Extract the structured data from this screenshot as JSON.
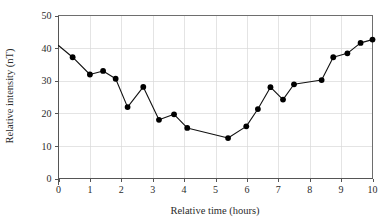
{
  "chart_data": {
    "type": "line",
    "title": "",
    "subtitle": "",
    "xlabel": "Relative time (hours)",
    "ylabel": "Relative intensity (nT)",
    "xlim": [
      0,
      10
    ],
    "ylim": [
      0,
      50
    ],
    "xticks": [
      0,
      1,
      2,
      3,
      4,
      5,
      6,
      7,
      8,
      9,
      10
    ],
    "yticks": [
      0,
      10,
      20,
      30,
      40,
      50
    ],
    "xtick_labels": [
      "0",
      "1",
      "2",
      "3",
      "4",
      "5",
      "6",
      "7",
      "8",
      "9",
      "10"
    ],
    "ytick_labels": [
      "0",
      "10",
      "20",
      "30",
      "40",
      "50"
    ],
    "grid": true,
    "grid_axes": "both",
    "legend": false,
    "legend_position": "none",
    "marker": "filled-circle",
    "line_color": "#111111",
    "marker_color": "#000000",
    "grid_color": "#d8d8d8",
    "frame_color": "#6e6e6e",
    "background_color": "#ffffff",
    "series": [
      {
        "name": "Relative intensity",
        "x": [
          0.0,
          0.45,
          1.0,
          1.42,
          1.82,
          2.2,
          2.7,
          3.2,
          3.68,
          4.1,
          5.4,
          5.98,
          6.35,
          6.75,
          7.15,
          7.5,
          8.38,
          8.75,
          9.2,
          9.62,
          10.0
        ],
        "values": [
          40.8,
          37.2,
          31.9,
          33.0,
          30.6,
          21.9,
          28.1,
          18.0,
          19.7,
          15.5,
          12.4,
          16.0,
          21.3,
          28.0,
          24.2,
          28.9,
          30.2,
          37.2,
          38.4,
          41.6,
          42.6
        ],
        "markers_shown_from_index": 1
      }
    ],
    "annotations": []
  }
}
